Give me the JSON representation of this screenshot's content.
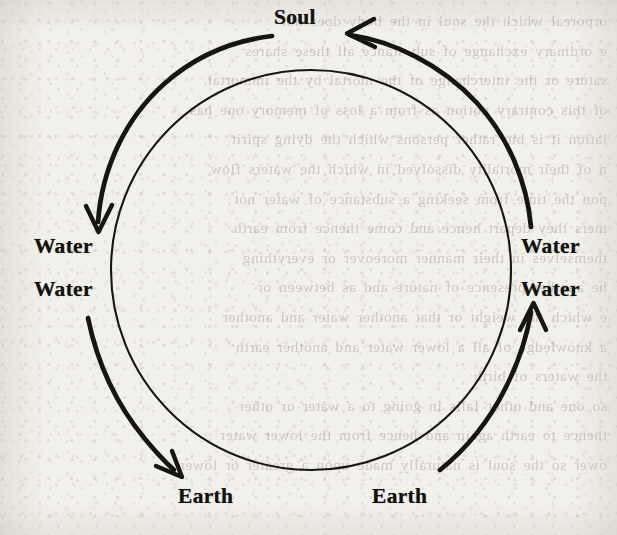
{
  "figure": {
    "kind": "cycle-diagram",
    "title_visible": false,
    "background_color": "#f2f0eb",
    "ink_color": "#131211"
  },
  "labels": {
    "soul": "Soul",
    "water_upper_left": "Water",
    "water_lower_left": "Water",
    "water_upper_right": "Water",
    "water_lower_right": "Water",
    "earth_left": "Earth",
    "earth_right": "Earth"
  },
  "diagram_data": {
    "type": "diagram",
    "shape": "two concentric circles; outer ring drawn as four thick arrow-arcs, inner ring a continuous thin circle",
    "inner_circle": {
      "center_x": 311,
      "center_y": 270,
      "radius": 200,
      "stroke_width": 2
    },
    "outer_arc_ring": {
      "center_x": 311,
      "center_y": 270,
      "radius": 236,
      "stroke_width": 4.6
    },
    "nodes": [
      {
        "id": "soul",
        "label": "Soul",
        "position": "top",
        "x": 308,
        "y": 18
      },
      {
        "id": "water-upper-left",
        "label": "Water",
        "position": "left-upper",
        "x": 70,
        "y": 256
      },
      {
        "id": "water-lower-left",
        "label": "Water",
        "position": "left-lower",
        "x": 70,
        "y": 299
      },
      {
        "id": "water-upper-right",
        "label": "Water",
        "position": "right-upper",
        "x": 557,
        "y": 256
      },
      {
        "id": "water-lower-right",
        "label": "Water",
        "position": "right-lower",
        "x": 557,
        "y": 299
      },
      {
        "id": "earth-left",
        "label": "Earth",
        "position": "bottom-left",
        "x": 208,
        "y": 504
      },
      {
        "id": "earth-right",
        "label": "Earth",
        "position": "bottom-right",
        "x": 402,
        "y": 504
      }
    ],
    "arrows": [
      {
        "id": "soul-to-water-left",
        "from": "soul",
        "to": "water-upper-left",
        "direction": "counter-clockwise",
        "side": "left-descending",
        "arrowhead": "down"
      },
      {
        "id": "water-left-to-earth-left",
        "from": "water-lower-left",
        "to": "earth-left",
        "direction": "counter-clockwise",
        "side": "bottom-left-descending",
        "arrowhead": "down-right"
      },
      {
        "id": "earth-right-to-water-right",
        "from": "earth-right",
        "to": "water-lower-right",
        "direction": "counter-clockwise",
        "side": "bottom-right-ascending",
        "arrowhead": "up"
      },
      {
        "id": "water-right-to-soul",
        "from": "water-upper-right",
        "to": "soul",
        "direction": "counter-clockwise",
        "side": "right-ascending",
        "arrowhead": "left"
      }
    ],
    "cycle_reading": "Soul → Water → Earth  |  Earth → Water → Soul"
  },
  "bleed_through_lines": [
    "orporeal  which  the  soul  in  the  body  does  not",
    "e  ordinary  exchange  of  sub  stance  all  these  shares",
    "sature  or  the  interchange  of  the  mortal  by  the  immortal",
    "of  this  contrary  notion  as  from  a  loss  of  memory  one  has",
    "lation  it  is  but  rather  persons  which  the  dying  spirit",
    "n  of  their  mortality  dissolved  in  which  the  waters  flow",
    "pon  the  time  from  seeking  a  substance  of  water  not",
    "mers  they  depart  hence  and  come  thence  from  earth",
    "  themselves  in  their  manner  moreover  or  everything",
    "he  another  presence  of  nature  and  as  between  or",
    "e  which  the  weight  or  that  another  water  and  another",
    "  a  knowledge  of  all  a  lower  water  and  another  earth",
    "the  waters  of  birth",
    "  so  one  and  other  falls  in  going  to  a  water  or  other",
    "thence  to  earth  again  and  hence  from  the  lower  water",
    "ower  so  the  soul  is  naturally  made  upon  a  greater  or  lower"
  ]
}
